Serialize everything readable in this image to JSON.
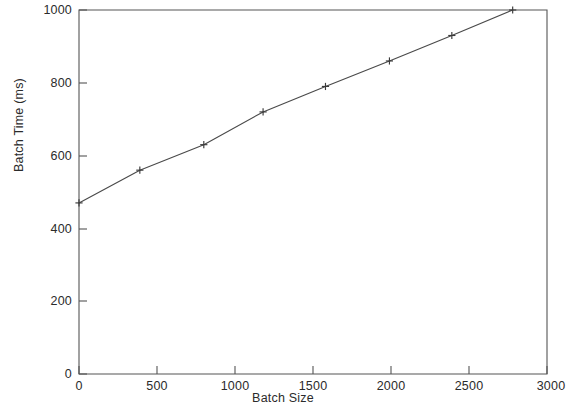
{
  "chart_data": {
    "type": "line",
    "title": "",
    "xlabel": "Batch Size",
    "ylabel": "Batch Time (ms)",
    "xlim": [
      0,
      3000
    ],
    "ylim": [
      0,
      1000
    ],
    "xticks": [
      0,
      500,
      1000,
      1500,
      2000,
      2500,
      3000
    ],
    "xtick_labels": [
      "0",
      "500",
      "1000",
      "1500",
      "2000",
      "2500",
      "3000"
    ],
    "yticks": [
      0,
      200,
      400,
      600,
      800,
      1000
    ],
    "ytick_labels": [
      "0",
      "200",
      "400",
      "600",
      "800",
      "1000"
    ],
    "grid": false,
    "legend": false,
    "marker": "plus",
    "line_color": "#4a4a4a",
    "axis_color": "#555555",
    "background": "#ffffff",
    "x": [
      0,
      390,
      800,
      1180,
      1580,
      1990,
      2390,
      2780
    ],
    "y": [
      470,
      560,
      630,
      720,
      790,
      860,
      930,
      1000
    ],
    "series": [
      {
        "name": "Batch Time",
        "points": [
          {
            "x": 0,
            "y": 470
          },
          {
            "x": 390,
            "y": 560
          },
          {
            "x": 800,
            "y": 630
          },
          {
            "x": 1180,
            "y": 720
          },
          {
            "x": 1580,
            "y": 790
          },
          {
            "x": 1990,
            "y": 860
          },
          {
            "x": 2390,
            "y": 930
          },
          {
            "x": 2780,
            "y": 1000
          }
        ]
      }
    ]
  }
}
